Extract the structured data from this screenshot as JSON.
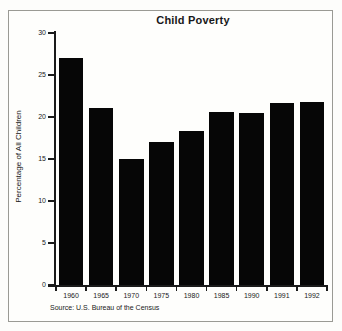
{
  "chart_data": {
    "type": "bar",
    "title": "Child Poverty",
    "xlabel": "",
    "ylabel": "Percentage of All Children",
    "categories": [
      "1960",
      "1965",
      "1970",
      "1975",
      "1980",
      "1985",
      "1990",
      "1991",
      "1992"
    ],
    "values": [
      27.0,
      21.1,
      15.0,
      17.0,
      18.3,
      20.6,
      20.5,
      21.7,
      21.8
    ],
    "ylim": [
      0,
      30
    ],
    "yticks": [
      0,
      5,
      10,
      15,
      20,
      25,
      30
    ],
    "ytick_labels": [
      "0",
      "5",
      "10",
      "15",
      "20",
      "25",
      "30"
    ],
    "grid": false,
    "legend": null,
    "bar_color": "#060606",
    "source": "Source: U.S. Bureau of the Census"
  },
  "figure": {
    "background": "#fdfdfb",
    "frame_color": "#9a9a94",
    "axis_color": "#1a1a1a"
  }
}
